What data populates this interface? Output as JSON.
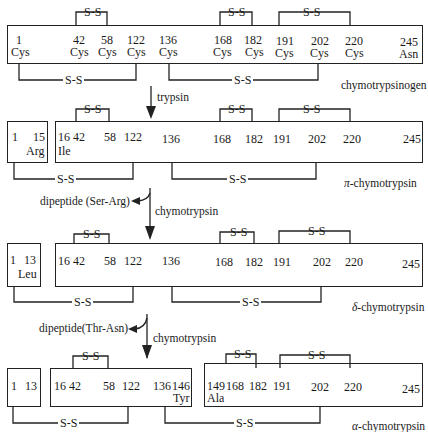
{
  "diagram": {
    "disulfide_label": "S-S",
    "stages": [
      {
        "name": "chymotrypsinogen",
        "segments": [
          {
            "positions": [
              "1",
              "42",
              "58",
              "122",
              "136",
              "168",
              "182",
              "191",
              "202",
              "220",
              "245"
            ],
            "residues": [
              "Cys",
              "Cys",
              "Cys",
              "Cys",
              "Cys",
              "Cys",
              "Cys",
              "Cys",
              "Cys",
              "Cys",
              "Asn"
            ]
          }
        ]
      },
      {
        "name": "π-chymotrypsin",
        "name_prefix": "π",
        "name_suffix": "-chymotrypsin",
        "segments": [
          {
            "positions": [
              "1",
              "15"
            ],
            "residues": [
              "Arg"
            ]
          },
          {
            "positions": [
              "16",
              "42",
              "58",
              "122",
              "136",
              "168",
              "182",
              "191",
              "202",
              "220",
              "245"
            ],
            "residues": [
              "Ile"
            ]
          }
        ]
      },
      {
        "name": "δ-chymotrypsin",
        "name_prefix": "δ",
        "name_suffix": "-chymotrypsin",
        "segments": [
          {
            "positions": [
              "1",
              "13"
            ],
            "residues": [
              "Leu"
            ]
          },
          {
            "positions": [
              "16",
              "42",
              "58",
              "122",
              "136",
              "168",
              "182",
              "191",
              "202",
              "220",
              "245"
            ]
          }
        ]
      },
      {
        "name": "α-chymotrypsin",
        "name_prefix": "α",
        "name_suffix": "-chymotrypsin",
        "segments": [
          {
            "positions": [
              "1",
              "13"
            ]
          },
          {
            "positions": [
              "16",
              "42",
              "58",
              "122",
              "136",
              "146"
            ],
            "residues": [
              "Tyr"
            ]
          },
          {
            "positions": [
              "149",
              "168",
              "182",
              "191",
              "202",
              "220",
              "245"
            ],
            "residues": [
              "Ala"
            ]
          }
        ]
      }
    ],
    "steps": [
      {
        "enzyme": "trypsin"
      },
      {
        "enzyme": "chymotrypsin",
        "released": "dipeptide (Ser-Arg)"
      },
      {
        "enzyme": "chymotrypsin",
        "released": "dipeptide(Thr-Asn)"
      }
    ]
  }
}
